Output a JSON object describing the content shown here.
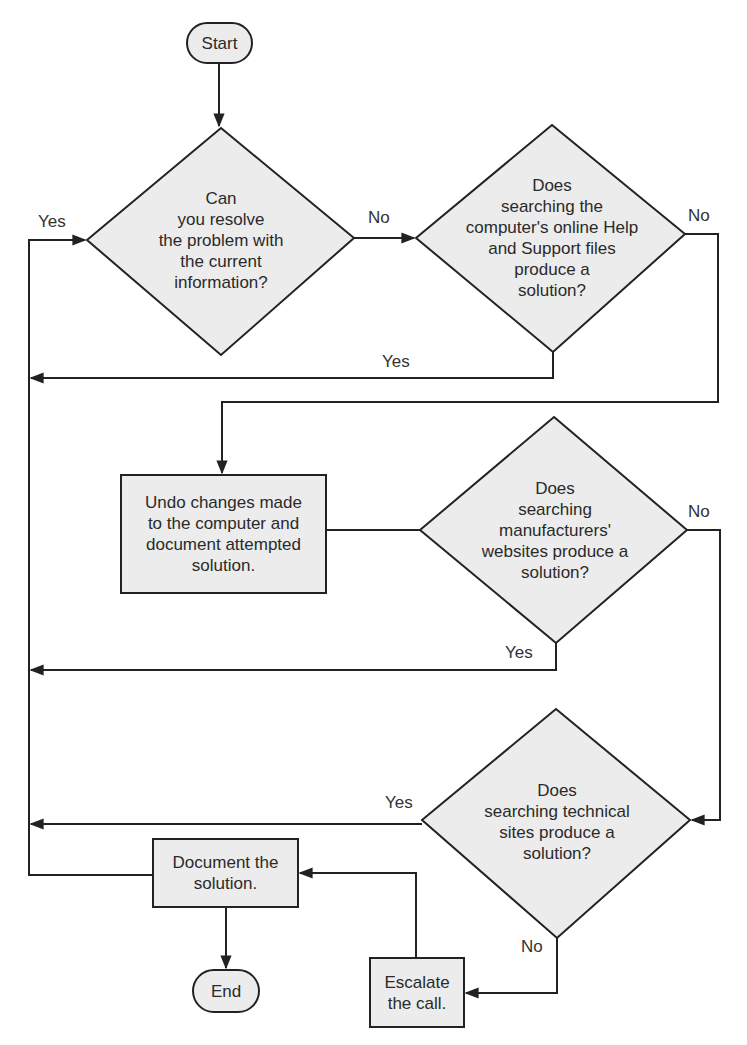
{
  "colors": {
    "fill": "#ececec",
    "stroke": "#222222",
    "background": "#ffffff"
  },
  "nodes": {
    "start": {
      "type": "terminator",
      "label": "Start"
    },
    "q1": {
      "type": "decision",
      "label": "Can\nyou resolve\nthe problem with\nthe current\ninformation?"
    },
    "q2": {
      "type": "decision",
      "label": "Does\nsearching the\ncomputer's online Help\nand Support files\nproduce a\nsolution?"
    },
    "undo": {
      "type": "process",
      "label": "Undo changes made\nto the computer and\ndocument attempted\nsolution."
    },
    "q3": {
      "type": "decision",
      "label": "Does\nsearching\nmanufacturers'\nwebsites produce a\nsolution?"
    },
    "q4": {
      "type": "decision",
      "label": "Does\nsearching technical\nsites produce a\nsolution?"
    },
    "document": {
      "type": "process",
      "label": "Document the\nsolution."
    },
    "escalate": {
      "type": "process",
      "label": "Escalate\nthe call."
    },
    "end": {
      "type": "terminator",
      "label": "End"
    }
  },
  "edge_labels": {
    "q1_yes": "Yes",
    "q1_no": "No",
    "q2_yes": "Yes",
    "q2_no": "No",
    "q3_yes": "Yes",
    "q3_no": "No",
    "q4_yes": "Yes",
    "q4_no": "No"
  }
}
